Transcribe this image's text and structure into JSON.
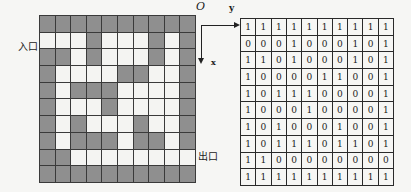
{
  "labels": {
    "entrance": "入口",
    "exit": "出口",
    "origin": "O",
    "y_axis": "y",
    "x_axis": "x"
  },
  "colors": {
    "wall": "#8f8f8f",
    "path": "#f4f4f2",
    "grid_line": "#3a3a3a"
  },
  "maze_matrix": [
    [
      1,
      1,
      1,
      1,
      1,
      1,
      1,
      1,
      1,
      1
    ],
    [
      0,
      0,
      0,
      1,
      0,
      0,
      0,
      1,
      0,
      1
    ],
    [
      1,
      1,
      0,
      1,
      0,
      0,
      0,
      1,
      0,
      1
    ],
    [
      1,
      0,
      0,
      0,
      0,
      1,
      1,
      0,
      0,
      1
    ],
    [
      1,
      0,
      1,
      1,
      1,
      0,
      0,
      0,
      0,
      1
    ],
    [
      1,
      0,
      0,
      0,
      1,
      0,
      0,
      0,
      0,
      1
    ],
    [
      1,
      0,
      1,
      0,
      0,
      0,
      1,
      0,
      0,
      1
    ],
    [
      1,
      0,
      1,
      1,
      1,
      0,
      1,
      1,
      0,
      1
    ],
    [
      1,
      1,
      0,
      0,
      0,
      0,
      0,
      0,
      0,
      0
    ],
    [
      1,
      1,
      1,
      1,
      1,
      1,
      1,
      1,
      1,
      1
    ]
  ]
}
